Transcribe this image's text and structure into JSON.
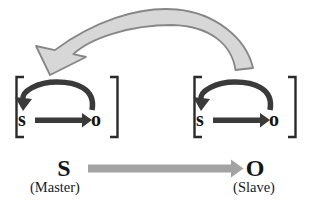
{
  "diagram": {
    "left_unit": {
      "subject": "s",
      "object": "o"
    },
    "right_unit": {
      "subject": "s",
      "object": "o"
    },
    "bottom": {
      "subject": "S",
      "subject_role": "(Master)",
      "object": "O",
      "object_role": "(Slave)"
    },
    "icons": {
      "feedback_arrow": "large-curved-arrow-from-right-unit-to-left-unit",
      "unit_loop_arrow": "curved-arrow-from-o-back-to-s",
      "unit_forward_arrow": "straight-arrow-s-to-o",
      "bottom_arrow": "straight-arrow-S-to-O",
      "brackets": "square-brackets-enclosing-unit"
    },
    "colors": {
      "background": "#ffffff",
      "feedback_arrow_fill": "#d7d7d7",
      "feedback_arrow_stroke": "#868686",
      "dark_arrow": "#3a3a3a",
      "bottom_arrow": "#a3a3a3",
      "bracket": "#2a2a2a",
      "text": "#151515"
    }
  }
}
